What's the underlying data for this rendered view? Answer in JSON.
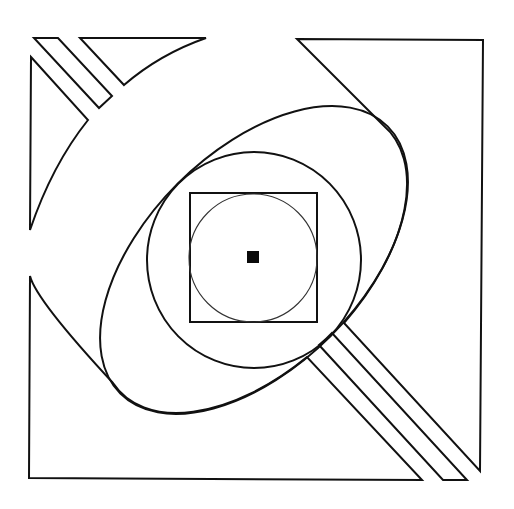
{
  "figure": {
    "width": 514,
    "height": 509,
    "background_color": "#ffffff",
    "line_color": "#111111",
    "center_mark_color": "#0a0a0a"
  },
  "shapes": {
    "center_square": {
      "x": 247,
      "y": 251,
      "size": 12
    },
    "inner_square": {
      "x": 190,
      "y": 193,
      "width": 127,
      "height": 129
    },
    "inner_circle": {
      "cx": 253,
      "cy": 258,
      "r": 64
    },
    "middle_circle": {
      "cx": 254,
      "cy": 260,
      "rx": 107,
      "ry": 108
    },
    "large_ellipse": {
      "cx": 254,
      "cy": 260,
      "rx": 189,
      "ry": 108,
      "rotation_deg": -45
    }
  }
}
